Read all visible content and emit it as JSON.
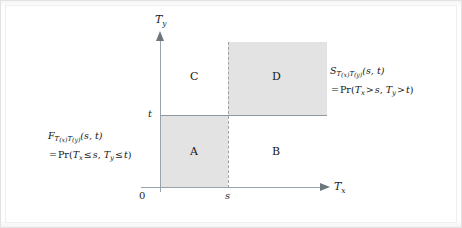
{
  "figure": {
    "type": "quadrant-diagram",
    "axes": {
      "y_label": "T",
      "y_label_sub": "y",
      "x_label": "T",
      "x_label_sub": "x"
    },
    "ticks": {
      "origin": "0",
      "x_tick": "s",
      "y_tick": "t"
    },
    "regions": [
      {
        "id": "A",
        "label": "A",
        "shaded": true,
        "x_range": "0 to s",
        "y_range": "0 to t"
      },
      {
        "id": "B",
        "label": "B",
        "shaded": false,
        "x_range": "s to inf",
        "y_range": "0 to t"
      },
      {
        "id": "C",
        "label": "C",
        "shaded": false,
        "x_range": "0 to s",
        "y_range": "t to inf"
      },
      {
        "id": "D",
        "label": "D",
        "shaded": true,
        "x_range": "s to inf",
        "y_range": "t to inf"
      }
    ],
    "annotations": {
      "left": {
        "name": "joint-distribution-function",
        "line1": {
          "fn": "F",
          "sub": "T(x)T(y)",
          "sub_main1": "T",
          "sub_paren1": "(x)",
          "sub_main2": "T",
          "sub_paren2": "(y)",
          "args": "(s, t)"
        },
        "line2": {
          "eq": "=",
          "pr": "Pr",
          "open": "(",
          "v1": "T",
          "v1_sub": "x",
          "rel1": "≤",
          "b1": "s",
          "comma": ",",
          "v2": "T",
          "v2_sub": "y",
          "rel2": "≤",
          "b2": "t",
          "close": ")"
        }
      },
      "right": {
        "name": "joint-survival-function",
        "line1": {
          "fn": "S",
          "sub": "T(x)T(y)",
          "sub_main1": "T",
          "sub_paren1": "(x)",
          "sub_main2": "T",
          "sub_paren2": "(y)",
          "args": "(s, t)"
        },
        "line2": {
          "eq": "=",
          "pr": "Pr",
          "open": "(",
          "v1": "T",
          "v1_sub": "x",
          "rel1": ">",
          "b1": "s",
          "comma": ",",
          "v2": "T",
          "v2_sub": "y",
          "rel2": ">",
          "b2": "t",
          "close": ")"
        }
      }
    },
    "colors": {
      "shade": "#e3e3e3",
      "axis": "#9aa2aa",
      "text": "#1d1d1d",
      "background": "#ffffff",
      "frame_border": "#e2e2e2"
    }
  }
}
